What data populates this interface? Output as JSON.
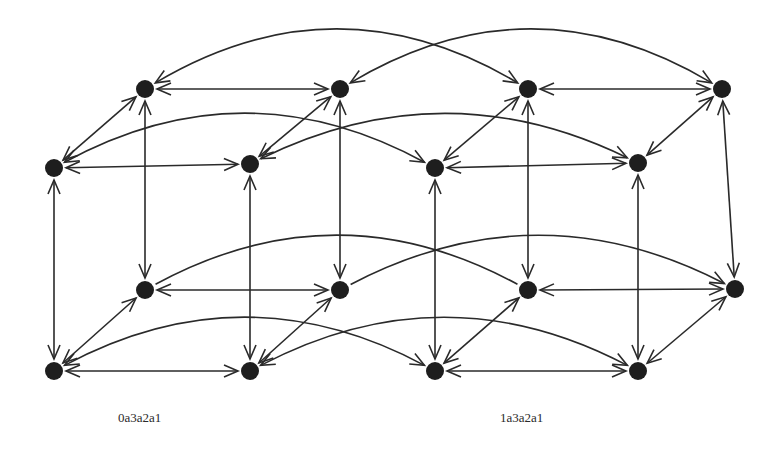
{
  "canvas": {
    "width": 780,
    "height": 456,
    "background": "#ffffff"
  },
  "style": {
    "stroke": "#2a2a2a",
    "node_fill": "#1e1e1e",
    "node_radius": 9,
    "stroke_width": 1.6
  },
  "labels": [
    {
      "id": "left",
      "text": "0a3a2a1",
      "x": 118,
      "y": 418
    },
    {
      "id": "right",
      "text": "1a3a2a1",
      "x": 500,
      "y": 418
    }
  ],
  "nodes": [
    {
      "id": "L_tb_l",
      "x": 145,
      "y": 89
    },
    {
      "id": "L_tb_r",
      "x": 340,
      "y": 89
    },
    {
      "id": "L_tf_l",
      "x": 54,
      "y": 168
    },
    {
      "id": "L_tf_r",
      "x": 250,
      "y": 164
    },
    {
      "id": "L_bb_l",
      "x": 145,
      "y": 290
    },
    {
      "id": "L_bb_r",
      "x": 340,
      "y": 290
    },
    {
      "id": "L_bf_l",
      "x": 54,
      "y": 371
    },
    {
      "id": "L_bf_r",
      "x": 250,
      "y": 371
    },
    {
      "id": "R_tb_l",
      "x": 528,
      "y": 89
    },
    {
      "id": "R_tb_r",
      "x": 722,
      "y": 89
    },
    {
      "id": "R_tf_l",
      "x": 435,
      "y": 168
    },
    {
      "id": "R_tf_r",
      "x": 638,
      "y": 163
    },
    {
      "id": "R_bb_l",
      "x": 528,
      "y": 290
    },
    {
      "id": "R_bb_r",
      "x": 735,
      "y": 289
    },
    {
      "id": "R_bf_l",
      "x": 435,
      "y": 371
    },
    {
      "id": "R_bf_r",
      "x": 638,
      "y": 371
    }
  ],
  "edges": [
    {
      "from": "L_tb_l",
      "to": "L_tb_r"
    },
    {
      "from": "L_tf_l",
      "to": "L_tf_r"
    },
    {
      "from": "L_bb_l",
      "to": "L_bb_r"
    },
    {
      "from": "L_bf_l",
      "to": "L_bf_r"
    },
    {
      "from": "L_tb_l",
      "to": "L_tf_l"
    },
    {
      "from": "L_tb_r",
      "to": "L_tf_r"
    },
    {
      "from": "L_bb_l",
      "to": "L_bf_l"
    },
    {
      "from": "L_bb_r",
      "to": "L_bf_r"
    },
    {
      "from": "L_tb_l",
      "to": "L_bb_l"
    },
    {
      "from": "L_tb_r",
      "to": "L_bb_r"
    },
    {
      "from": "L_tf_l",
      "to": "L_bf_l"
    },
    {
      "from": "L_tf_r",
      "to": "L_bf_r"
    },
    {
      "from": "R_tb_l",
      "to": "R_tb_r"
    },
    {
      "from": "R_tf_l",
      "to": "R_tf_r"
    },
    {
      "from": "R_bb_l",
      "to": "R_bb_r"
    },
    {
      "from": "R_bf_l",
      "to": "R_bf_r"
    },
    {
      "from": "R_tb_l",
      "to": "R_tf_l"
    },
    {
      "from": "R_tb_r",
      "to": "R_tf_r"
    },
    {
      "from": "R_bb_l",
      "to": "R_bf_l"
    },
    {
      "from": "R_bb_r",
      "to": "R_bf_r"
    },
    {
      "from": "R_tb_l",
      "to": "R_bb_l"
    },
    {
      "from": "R_tb_r",
      "to": "R_bb_r"
    },
    {
      "from": "R_tf_l",
      "to": "R_bf_l"
    },
    {
      "from": "R_tf_r",
      "to": "R_bf_r"
    }
  ],
  "arcs": [
    {
      "from": "L_tb_l",
      "to": "R_tb_l",
      "peak_y": 32,
      "head_start": true,
      "head_end": true
    },
    {
      "from": "L_tb_r",
      "to": "R_tb_r",
      "peak_y": 32,
      "head_start": true,
      "head_end": true
    },
    {
      "from": "L_tf_l",
      "to": "R_tf_l",
      "peak_y": 116,
      "head_start": true,
      "head_end": true
    },
    {
      "from": "L_tf_r",
      "to": "R_tf_r",
      "peak_y": 116,
      "head_start": true,
      "head_end": true
    },
    {
      "from": "L_bb_l",
      "to": "R_bb_l",
      "peak_y": 238,
      "head_start": false,
      "head_end": false
    },
    {
      "from": "L_bb_r",
      "to": "R_bb_r",
      "peak_y": 238,
      "head_start": false,
      "head_end": true
    },
    {
      "from": "L_bf_l",
      "to": "R_bf_l",
      "peak_y": 320,
      "head_start": true,
      "head_end": true
    },
    {
      "from": "L_bf_r",
      "to": "R_bf_r",
      "peak_y": 320,
      "head_start": true,
      "head_end": true
    }
  ]
}
